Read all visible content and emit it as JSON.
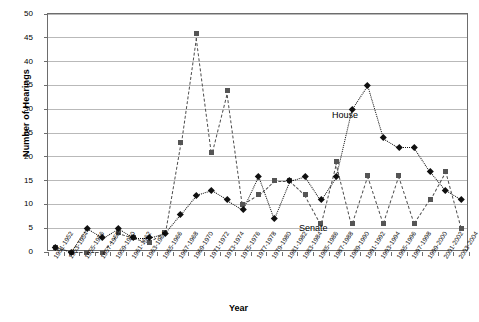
{
  "chart_data": {
    "type": "line",
    "title": "",
    "xlabel": "Year",
    "ylabel": "Number of Hearings",
    "ylim": [
      0,
      50
    ],
    "ytick_step": 5,
    "yticks": [
      0,
      5,
      10,
      15,
      20,
      25,
      30,
      35,
      40,
      45,
      50
    ],
    "grid": true,
    "legend_position": "inline-annotations",
    "categories": [
      "1951-1952",
      "1953-1954",
      "1955-1956",
      "1957-1958",
      "1959-1960",
      "1961-1962",
      "1963-1964",
      "1965-1966",
      "1967-1968",
      "1969-1970",
      "1971-1972",
      "1973-1974",
      "1975-1976",
      "1977-1978",
      "1979-1980",
      "1981-1982",
      "1983-1984",
      "1985-1986",
      "1987-1988",
      "1989-1990",
      "1991-1992",
      "1993-1994",
      "1995-1996",
      "1997-1998",
      "1999-2000",
      "2001-2002",
      "2003-2004"
    ],
    "series": [
      {
        "name": "House",
        "marker": "diamond",
        "line_style": "dotted",
        "color": "#101010",
        "values": [
          1,
          0,
          5,
          3,
          5,
          3,
          3,
          4,
          8,
          12,
          13,
          11,
          9,
          16,
          7,
          15,
          16,
          11,
          16,
          30,
          35,
          24,
          22,
          22,
          17,
          13,
          11
        ]
      },
      {
        "name": "Senate",
        "marker": "square",
        "line_style": "dashed",
        "color": "#555555",
        "values": [
          1,
          0,
          0,
          0,
          4,
          3,
          2,
          4,
          23,
          46,
          21,
          34,
          10,
          12,
          15,
          15,
          12,
          6,
          19,
          6,
          16,
          6,
          16,
          6,
          11,
          17,
          5
        ]
      }
    ],
    "annotations": [
      {
        "text": "House",
        "series": "House"
      },
      {
        "text": "Senate",
        "series": "Senate"
      }
    ]
  }
}
